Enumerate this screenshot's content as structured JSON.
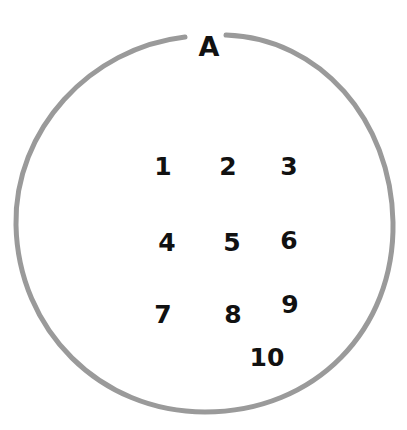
{
  "diagram": {
    "type": "set-diagram",
    "set": {
      "name": "A",
      "stroke_color": "#9a9a9a",
      "label_color": "#111111"
    },
    "elements": [
      {
        "label": "1",
        "x": 163,
        "y": 166
      },
      {
        "label": "2",
        "x": 228,
        "y": 166
      },
      {
        "label": "3",
        "x": 289,
        "y": 166
      },
      {
        "label": "4",
        "x": 167,
        "y": 242
      },
      {
        "label": "5",
        "x": 232,
        "y": 242
      },
      {
        "label": "6",
        "x": 289,
        "y": 240
      },
      {
        "label": "7",
        "x": 163,
        "y": 314
      },
      {
        "label": "8",
        "x": 233,
        "y": 314
      },
      {
        "label": "9",
        "x": 290,
        "y": 304
      },
      {
        "label": "10",
        "x": 267,
        "y": 357
      }
    ]
  }
}
